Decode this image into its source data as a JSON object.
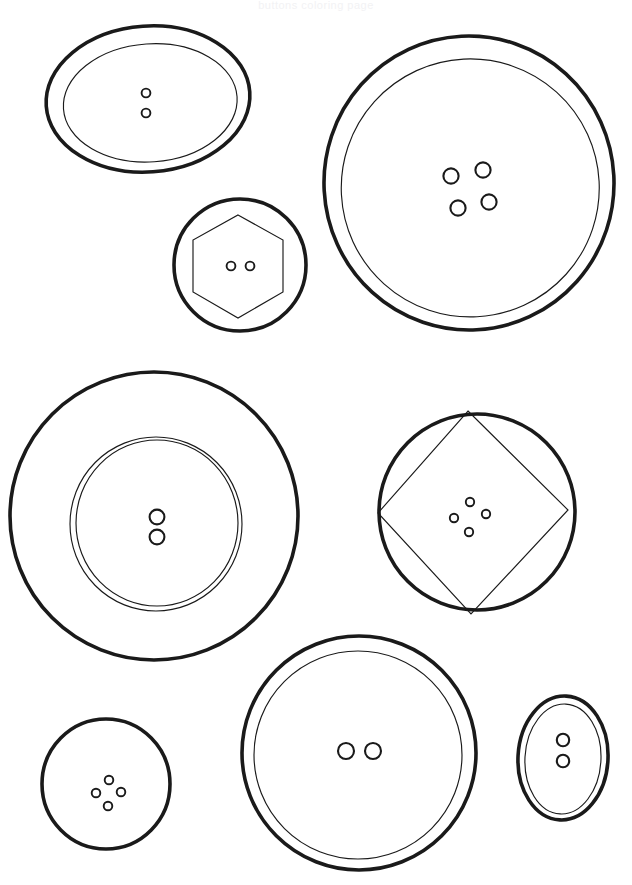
{
  "page": {
    "title_strip_text": "buttons coloring page",
    "background_color": "#ffffff",
    "ink_color": "#1a1a1a",
    "width": 632,
    "height": 885
  },
  "artwork": {
    "name": "buttons-line-art",
    "description": "Eight sewing buttons drawn as black outline line art on a white background",
    "button_count": 8
  },
  "buttons": [
    {
      "id": "button-1",
      "label": "Oval button, two holes",
      "outer_shape": "ellipse",
      "inner_shape": "ellipse",
      "hole_count": 2,
      "hole_layout": "vertical-pair",
      "center": {
        "x": 148,
        "y": 99
      },
      "outer_rx": 102,
      "outer_ry": 73,
      "rotation_deg": -4,
      "inner_rx": 87,
      "inner_ry": 59,
      "inner_offset": {
        "x": 2,
        "y": 4
      },
      "hole_radius": 4.4,
      "holes": [
        {
          "x": 146,
          "y": 93
        },
        {
          "x": 146,
          "y": 113
        }
      ]
    },
    {
      "id": "button-2",
      "label": "Large round button, four holes",
      "outer_shape": "circle",
      "inner_shape": "circle",
      "hole_count": 4,
      "hole_layout": "diamond",
      "center": {
        "x": 469,
        "y": 183
      },
      "outer_rx": 145,
      "outer_ry": 147,
      "rotation_deg": -3,
      "inner_rx": 129,
      "inner_ry": 129,
      "inner_offset": {
        "x": 1,
        "y": 5
      },
      "hole_radius": 7.6,
      "holes": [
        {
          "x": 451,
          "y": 176
        },
        {
          "x": 483,
          "y": 170
        },
        {
          "x": 458,
          "y": 208
        },
        {
          "x": 489,
          "y": 202
        }
      ]
    },
    {
      "id": "button-3",
      "label": "Round button with hexagon inset, two holes",
      "outer_shape": "circle",
      "inner_shape": "hexagon",
      "hole_count": 2,
      "hole_layout": "horizontal-pair",
      "center": {
        "x": 240,
        "y": 265
      },
      "outer_rx": 66,
      "outer_ry": 66,
      "rotation_deg": 0,
      "inner_rx": 52,
      "inner_ry": 52,
      "inner_offset": {
        "x": -2,
        "y": 2
      },
      "hole_radius": 4.4,
      "holes": [
        {
          "x": 231,
          "y": 266
        },
        {
          "x": 250,
          "y": 266
        }
      ]
    },
    {
      "id": "button-4",
      "label": "Large round button with double inner ring, two holes",
      "outer_shape": "circle",
      "inner_shape": "double-circle",
      "hole_count": 2,
      "hole_layout": "vertical-pair",
      "center": {
        "x": 154,
        "y": 516
      },
      "outer_rx": 144,
      "outer_ry": 144,
      "rotation_deg": 0,
      "inner_rx": 84,
      "inner_ry": 85,
      "inner_offset": {
        "x": 2,
        "y": 8
      },
      "hole_radius": 7.4,
      "holes": [
        {
          "x": 157,
          "y": 517
        },
        {
          "x": 157,
          "y": 536
        }
      ]
    },
    {
      "id": "button-5",
      "label": "Round button with diamond inset, four holes",
      "outer_shape": "circle",
      "inner_shape": "diamond",
      "hole_count": 4,
      "hole_layout": "diamond",
      "center": {
        "x": 477,
        "y": 512
      },
      "outer_rx": 97,
      "outer_ry": 98,
      "rotation_deg": 0,
      "inner_rx": 92,
      "inner_ry": 99,
      "inner_offset": {
        "x": -3,
        "y": 0
      },
      "hole_radius": 4.2,
      "holes": [
        {
          "x": 470,
          "y": 503
        },
        {
          "x": 455,
          "y": 518
        },
        {
          "x": 486,
          "y": 514
        },
        {
          "x": 469,
          "y": 531
        }
      ]
    },
    {
      "id": "button-6",
      "label": "Small round button, four holes",
      "outer_shape": "circle",
      "inner_shape": "none",
      "hole_count": 4,
      "hole_layout": "diamond",
      "center": {
        "x": 106,
        "y": 784
      },
      "outer_rx": 64,
      "outer_ry": 65,
      "rotation_deg": 0,
      "hole_radius": 4.3,
      "holes": [
        {
          "x": 109,
          "y": 780
        },
        {
          "x": 96,
          "y": 793
        },
        {
          "x": 121,
          "y": 793
        },
        {
          "x": 108,
          "y": 806
        }
      ]
    },
    {
      "id": "button-7",
      "label": "Round button with inner ring, two holes",
      "outer_shape": "circle",
      "inner_shape": "circle",
      "hole_count": 2,
      "hole_layout": "horizontal-pair",
      "center": {
        "x": 359,
        "y": 753
      },
      "outer_rx": 117,
      "outer_ry": 117,
      "rotation_deg": 0,
      "inner_rx": 104,
      "inner_ry": 104,
      "inner_offset": {
        "x": -1,
        "y": 2
      },
      "hole_radius": 8.0,
      "holes": [
        {
          "x": 346,
          "y": 751
        },
        {
          "x": 373,
          "y": 751
        }
      ]
    },
    {
      "id": "button-8",
      "label": "Small vertical oval button, two holes",
      "outer_shape": "ellipse",
      "inner_shape": "ellipse",
      "hole_count": 2,
      "hole_layout": "vertical-pair",
      "center": {
        "x": 563,
        "y": 758
      },
      "outer_rx": 45,
      "outer_ry": 62,
      "rotation_deg": 3,
      "inner_rx": 38,
      "inner_ry": 55,
      "inner_offset": {
        "x": 0,
        "y": 1
      },
      "hole_radius": 6.2,
      "holes": [
        {
          "x": 563,
          "y": 740
        },
        {
          "x": 563,
          "y": 761
        }
      ]
    }
  ]
}
